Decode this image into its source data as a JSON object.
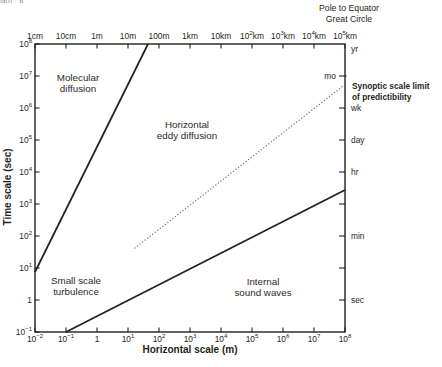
{
  "chart_data": {
    "type": "line",
    "title": "",
    "xlabel": "Horizontal scale (m)",
    "ylabel": "Time scale (sec)",
    "grid": false,
    "legend": "none",
    "x_log_range": [
      -2,
      8
    ],
    "y_log_range": [
      -1,
      8
    ],
    "plot_box": {
      "left": 35,
      "top": 44,
      "right": 345,
      "bottom": 332
    },
    "x_ticks_bottom": [
      {
        "log": -2,
        "base": "10",
        "exp": "−2"
      },
      {
        "log": -1,
        "base": "10",
        "exp": "−1"
      },
      {
        "log": 0,
        "text": "1"
      },
      {
        "log": 1,
        "base": "10",
        "exp": "1"
      },
      {
        "log": 2,
        "base": "10",
        "exp": "2"
      },
      {
        "log": 3,
        "base": "10",
        "exp": "3"
      },
      {
        "log": 4,
        "base": "10",
        "exp": "4"
      },
      {
        "log": 5,
        "base": "10",
        "exp": "5"
      },
      {
        "log": 6,
        "base": "10",
        "exp": "6"
      },
      {
        "log": 7,
        "base": "10",
        "exp": "7"
      },
      {
        "log": 8,
        "base": "10",
        "exp": "8"
      }
    ],
    "x_ticks_top": [
      {
        "log": -2,
        "text": "1cm"
      },
      {
        "log": -1,
        "text": "10cm"
      },
      {
        "log": 0,
        "text": "1m"
      },
      {
        "log": 1,
        "text": "10m"
      },
      {
        "log": 2,
        "text": "100m"
      },
      {
        "log": 3,
        "text": "1km"
      },
      {
        "log": 4,
        "text": "10km"
      },
      {
        "log": 5,
        "base": "10",
        "exp": "2",
        "suffix": "km"
      },
      {
        "log": 6,
        "base": "10",
        "exp": "3",
        "suffix": "km"
      },
      {
        "log": 7,
        "base": "10",
        "exp": "4",
        "suffix": "km"
      },
      {
        "log": 8,
        "base": "10",
        "exp": "5",
        "suffix": "km"
      }
    ],
    "y_ticks_left": [
      {
        "log": 8,
        "base": "10",
        "exp": "8"
      },
      {
        "log": 7,
        "base": "10",
        "exp": "7"
      },
      {
        "log": 6,
        "base": "10",
        "exp": "6"
      },
      {
        "log": 5,
        "base": "10",
        "exp": "5"
      },
      {
        "log": 4,
        "base": "10",
        "exp": "4"
      },
      {
        "log": 3,
        "base": "10",
        "exp": "3"
      },
      {
        "log": 2,
        "base": "10",
        "exp": "2"
      },
      {
        "log": 1,
        "base": "10",
        "exp": "1"
      },
      {
        "log": 0,
        "text": "1"
      },
      {
        "log": -1,
        "base": "10",
        "exp": "−1"
      }
    ],
    "y_ticks_right": [
      {
        "log": 7.84,
        "text": "yr",
        "tick": false,
        "side": "out"
      },
      {
        "log": 7,
        "text": "mo",
        "tick": true,
        "side": "in"
      },
      {
        "log": 6,
        "text": "wk",
        "tick": true,
        "side": "out"
      },
      {
        "log": 5,
        "text": "day",
        "tick": true,
        "side": "out"
      },
      {
        "log": 4,
        "text": "hr",
        "tick": true,
        "side": "out"
      },
      {
        "log": 3,
        "text": "",
        "tick": true,
        "side": "out"
      },
      {
        "log": 2,
        "text": "min",
        "tick": true,
        "side": "out"
      },
      {
        "log": 1,
        "text": "",
        "tick": true,
        "side": "out"
      },
      {
        "log": 0,
        "text": "sec",
        "tick": true,
        "side": "out"
      }
    ],
    "series": [
      {
        "name": "molecular-diffusion-boundary",
        "style": "solid",
        "points_log10": [
          [
            -2,
            0.875
          ],
          [
            1.645,
            8
          ]
        ]
      },
      {
        "name": "internal-sound-waves-boundary",
        "style": "solid",
        "points_log10": [
          [
            -1,
            -1
          ],
          [
            8,
            3.44
          ]
        ]
      },
      {
        "name": "phenomena-scale-line",
        "style": "dotted",
        "points_log10": [
          [
            1.226,
            1.625
          ],
          [
            7.935,
            6.688
          ]
        ]
      }
    ],
    "region_labels": [
      {
        "lines": [
          "Molecular",
          "diffusion"
        ],
        "log_x": -0.613,
        "log_y": 6.78
      },
      {
        "lines": [
          "Horizontal",
          "eddy diffusion"
        ],
        "log_x": 2.903,
        "log_y": 5.31
      },
      {
        "lines": [
          "Small scale",
          "turbulence"
        ],
        "log_x": -0.677,
        "log_y": 0.44
      },
      {
        "lines": [
          "Internal",
          "sound waves"
        ],
        "log_x": 5.355,
        "log_y": 0.41
      }
    ],
    "phenomena": [
      {
        "lines": [
          "Small",
          "cumulus"
        ],
        "log_x": 2.484,
        "log_y": 2.563
      },
      {
        "lines": [
          "Large cumulus",
          "and tornados"
        ],
        "log_x": 3.548,
        "log_y": 3.375
      },
      {
        "lines": [
          "Thunder",
          "storms"
        ],
        "log_x": 4.355,
        "log_y": 4.063
      },
      {
        "lines": [
          "Fronts"
        ],
        "log_x": 4.968,
        "log_y": 4.438
      },
      {
        "lines": [
          "Tropical",
          "cyclones"
        ],
        "log_x": 5.516,
        "log_y": 4.813
      },
      {
        "lines": [
          "Extra tropical",
          "cyclones"
        ],
        "log_x": 6.29,
        "log_y": 5.406
      },
      {
        "lines": [
          "Jet",
          "stream"
        ],
        "log_x": 7.419,
        "log_y": 6.281
      }
    ],
    "annotations": [
      {
        "name": "pole-to-equator-note",
        "lines": [
          "Pole to Equator",
          "Great Circle"
        ],
        "x": 349,
        "y": 11,
        "line_height": 11,
        "size": 8.7,
        "weight": "normal",
        "anchor": "middle"
      },
      {
        "name": "synoptic-limit-note",
        "lines": [
          "Synoptic scale limit",
          "of predictibility"
        ],
        "x": 352,
        "y": 89,
        "line_height": 10.5,
        "size": 8.3,
        "weight": "bold",
        "anchor": "start"
      }
    ],
    "colors": {
      "background": "#ffffff",
      "axis": "#231f20",
      "solid_line": "#231f20",
      "dotted_line": "#808080",
      "phenomena_text": "#8f8f8f",
      "region_text": "#2b2b2b"
    }
  }
}
